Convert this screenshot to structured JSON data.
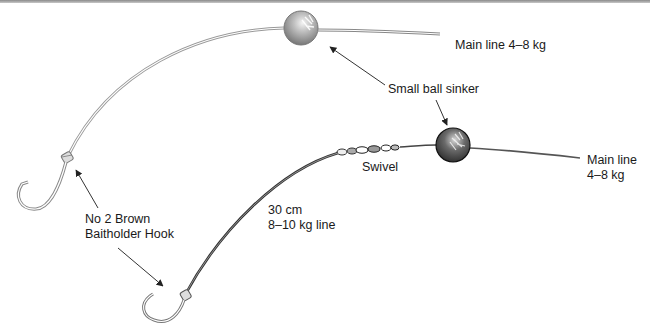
{
  "diagram": {
    "rig_top": {
      "main_line_label": "Main line 4–8 kg",
      "hook_label_line1": "No 2 Brown",
      "hook_label_line2": "Baitholder Hook"
    },
    "shared": {
      "sinker_label": "Small ball sinker"
    },
    "rig_bottom": {
      "main_line_label_line1": "Main line",
      "main_line_label_line2": "4–8 kg",
      "swivel_label": "Swivel",
      "leader_label_line1": "30 cm",
      "leader_label_line2": "8–10 kg line"
    },
    "colors": {
      "line_top": "#9a9a9a",
      "line_bottom": "#3a3a3a",
      "sinker_top": "#a8a8a8",
      "sinker_bottom": "#6a6a6a",
      "arrow": "#333333",
      "text": "#1a1a1a"
    }
  }
}
